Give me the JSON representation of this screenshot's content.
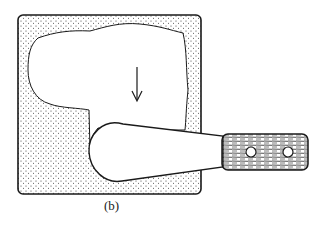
{
  "figure": {
    "caption": "(b)",
    "arrow_direction": "down",
    "colors": {
      "stroke": "#1a1a1a",
      "background": "#ffffff",
      "stipple": "#333333"
    }
  }
}
